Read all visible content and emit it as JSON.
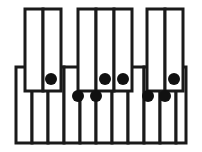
{
  "diagram": {
    "type": "piano-keyboard",
    "canvas": {
      "width": 202,
      "height": 152
    },
    "colors": {
      "key_fill": "#ffffff",
      "outline": "#1a1a1a",
      "marker": "#111111",
      "background": "#ffffff"
    },
    "geometry": {
      "stroke_width": 3,
      "upper_band_top": 9,
      "upper_band_bottom": 67,
      "lower_band_top": 67,
      "lower_band_bottom": 143,
      "white_row_left": 16,
      "white_row_right": 186
    },
    "upper_keys": [
      {
        "name": "upper-key-1",
        "x": 25,
        "width": 18,
        "group": 1
      },
      {
        "name": "upper-key-2",
        "x": 43,
        "width": 18,
        "group": 1
      },
      {
        "name": "upper-key-3",
        "x": 78,
        "width": 18,
        "group": 2
      },
      {
        "name": "upper-key-4",
        "x": 96,
        "width": 18,
        "group": 2
      },
      {
        "name": "upper-key-5",
        "x": 114,
        "width": 18,
        "group": 2
      },
      {
        "name": "upper-key-6",
        "x": 147,
        "width": 18,
        "group": 3
      },
      {
        "name": "upper-key-7",
        "x": 165,
        "width": 18,
        "group": 3
      }
    ],
    "upper_groups": [
      {
        "name": "upper-group-left",
        "x": 25,
        "width": 36,
        "count": 2
      },
      {
        "name": "upper-group-middle",
        "x": 78,
        "width": 54,
        "count": 3
      },
      {
        "name": "upper-group-right",
        "x": 147,
        "width": 36,
        "count": 2
      }
    ],
    "lower_keys": [
      {
        "name": "lower-key-1",
        "x": 16,
        "width": 16
      },
      {
        "name": "lower-key-2",
        "x": 32,
        "width": 16
      },
      {
        "name": "lower-key-3",
        "x": 48,
        "width": 16
      },
      {
        "name": "lower-key-4",
        "x": 64,
        "width": 16
      },
      {
        "name": "lower-key-5",
        "x": 80,
        "width": 16
      },
      {
        "name": "lower-key-6",
        "x": 96,
        "width": 16
      },
      {
        "name": "lower-key-7",
        "x": 112,
        "width": 16
      },
      {
        "name": "lower-key-8",
        "x": 128,
        "width": 16
      },
      {
        "name": "lower-key-9",
        "x": 144,
        "width": 16
      },
      {
        "name": "lower-key-10",
        "x": 160,
        "width": 16
      },
      {
        "name": "lower-key-11",
        "x": 176,
        "width": 10
      }
    ],
    "markers": [
      {
        "name": "marker-1",
        "cx": 51,
        "cy": 79,
        "r": 6,
        "row": "upper"
      },
      {
        "name": "marker-2",
        "cx": 78,
        "cy": 96,
        "r": 6,
        "row": "lower"
      },
      {
        "name": "marker-3",
        "cx": 96,
        "cy": 96,
        "r": 6,
        "row": "lower"
      },
      {
        "name": "marker-4",
        "cx": 105,
        "cy": 79,
        "r": 6,
        "row": "upper"
      },
      {
        "name": "marker-5",
        "cx": 123,
        "cy": 79,
        "r": 6,
        "row": "upper"
      },
      {
        "name": "marker-6",
        "cx": 148,
        "cy": 96,
        "r": 6,
        "row": "lower"
      },
      {
        "name": "marker-7",
        "cx": 165,
        "cy": 96,
        "r": 6,
        "row": "lower"
      },
      {
        "name": "marker-8",
        "cx": 174,
        "cy": 79,
        "r": 6,
        "row": "upper"
      }
    ],
    "marker_count": 8,
    "upper_key_count": 7,
    "lower_key_count": 11
  }
}
